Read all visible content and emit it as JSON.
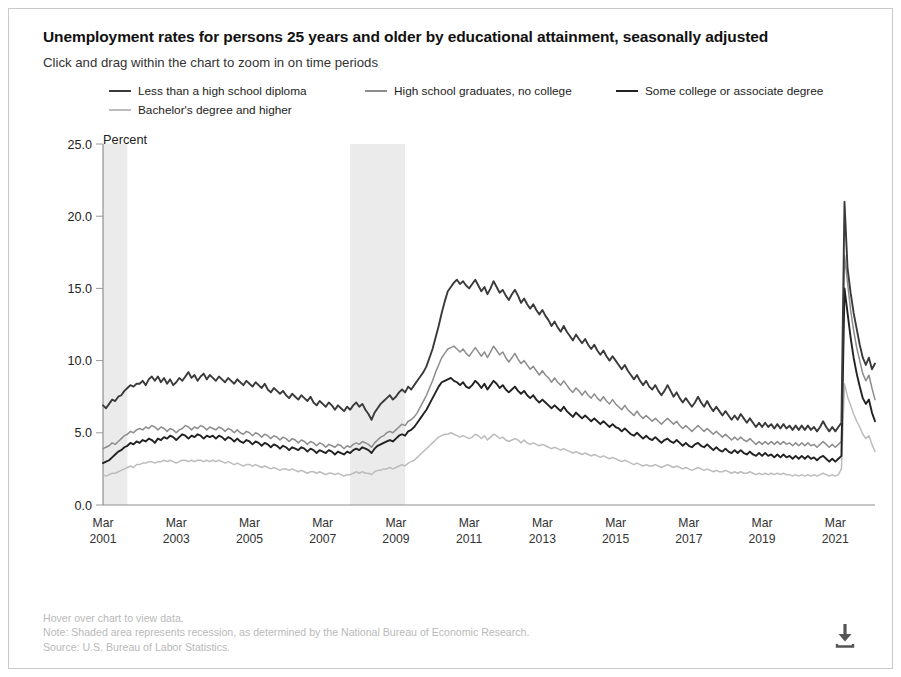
{
  "header": {
    "title": "Unemployment rates for persons 25 years and older by educational attainment, seasonally adjusted",
    "subtitle": "Click and drag within the chart to zoom in on time periods"
  },
  "footer": {
    "hover_hint": "Hover over chart to view data.",
    "note": "Note: Shaded area represents recession, as determined by the National Bureau of Economic Research.",
    "source": "Source: U.S. Bureau of Labor Statistics.",
    "download_icon": "download-icon"
  },
  "chart_data": {
    "type": "line",
    "title": "Unemployment rates for persons 25 years and older by educational attainment, seasonally adjusted",
    "subtitle": "Click and drag within the chart to zoom in on time periods",
    "xlabel": "",
    "ylabel": "Percent",
    "ylim": [
      0.0,
      25.0
    ],
    "ytick_labels": [
      "0.0",
      "5.0",
      "10.0",
      "15.0",
      "20.0",
      "25.0"
    ],
    "ytick_values": [
      0,
      5,
      10,
      15,
      20,
      25
    ],
    "grid": false,
    "legend_position": "top",
    "xtick_labels": [
      "Mar\n2001",
      "Mar\n2003",
      "Mar\n2005",
      "Mar\n2007",
      "Mar\n2009",
      "Mar\n2011",
      "Mar\n2013",
      "Mar\n2015",
      "Mar\n2017",
      "Mar\n2019",
      "Mar\n2021"
    ],
    "xticks": [
      {
        "top": "Mar",
        "bottom": "2001"
      },
      {
        "top": "Mar",
        "bottom": "2003"
      },
      {
        "top": "Mar",
        "bottom": "2005"
      },
      {
        "top": "Mar",
        "bottom": "2007"
      },
      {
        "top": "Mar",
        "bottom": "2009"
      },
      {
        "top": "Mar",
        "bottom": "2011"
      },
      {
        "top": "Mar",
        "bottom": "2013"
      },
      {
        "top": "Mar",
        "bottom": "2015"
      },
      {
        "top": "Mar",
        "bottom": "2017"
      },
      {
        "top": "Mar",
        "bottom": "2019"
      },
      {
        "top": "Mar",
        "bottom": "2021"
      }
    ],
    "x_start": "2001-03",
    "x_end": "2021-03",
    "x_step_months": 1,
    "recessions": [
      {
        "label": "2001 recession",
        "start": "2001-03",
        "end": "2001-11"
      },
      {
        "label": "Great Recession",
        "start": "2007-12",
        "end": "2009-06"
      }
    ],
    "recession_color": "#ebebeb",
    "annotations": [
      "Shaded area represents recession, as determined by the National Bureau of Economic Research."
    ],
    "series": [
      {
        "name": "Less than a high school diploma",
        "color": "#3a3a3a",
        "values": [
          6.9,
          6.7,
          7.0,
          7.3,
          7.2,
          7.5,
          7.6,
          7.9,
          8.1,
          8.3,
          8.2,
          8.4,
          8.4,
          8.6,
          8.3,
          8.7,
          8.9,
          8.6,
          8.9,
          8.5,
          8.8,
          8.4,
          8.7,
          8.3,
          8.5,
          8.8,
          8.6,
          8.9,
          9.2,
          8.8,
          9.0,
          8.6,
          8.9,
          9.1,
          8.7,
          9.0,
          8.8,
          8.6,
          8.9,
          8.7,
          8.5,
          8.8,
          8.6,
          8.4,
          8.7,
          8.5,
          8.3,
          8.6,
          8.4,
          8.2,
          8.5,
          8.3,
          8.1,
          8.4,
          8.0,
          7.8,
          8.1,
          7.9,
          7.7,
          7.9,
          7.6,
          7.4,
          7.7,
          7.5,
          7.3,
          7.6,
          7.4,
          7.2,
          7.5,
          7.1,
          6.9,
          7.2,
          7.0,
          6.8,
          7.1,
          6.9,
          6.6,
          6.9,
          6.7,
          6.5,
          6.8,
          6.6,
          6.9,
          7.1,
          6.8,
          7.0,
          6.6,
          6.3,
          5.9,
          6.4,
          6.7,
          7.0,
          7.2,
          7.4,
          7.6,
          7.3,
          7.5,
          7.8,
          8.0,
          7.8,
          8.2,
          8.0,
          8.3,
          8.6,
          8.9,
          9.2,
          9.6,
          10.2,
          10.8,
          11.6,
          12.4,
          13.3,
          14.1,
          14.8,
          15.1,
          15.4,
          15.6,
          15.3,
          15.5,
          15.2,
          15.0,
          15.3,
          15.6,
          15.2,
          14.8,
          15.1,
          14.6,
          15.0,
          15.5,
          15.1,
          14.7,
          14.9,
          14.5,
          14.2,
          14.6,
          14.9,
          14.5,
          14.0,
          14.3,
          13.9,
          13.6,
          13.9,
          13.5,
          13.2,
          13.5,
          13.1,
          12.8,
          12.4,
          12.7,
          12.3,
          12.0,
          12.4,
          12.0,
          11.7,
          11.4,
          11.8,
          11.5,
          11.2,
          11.5,
          11.1,
          10.8,
          11.1,
          10.7,
          10.4,
          10.7,
          10.3,
          10.0,
          10.3,
          10.0,
          9.7,
          9.4,
          9.7,
          9.3,
          9.0,
          8.7,
          9.0,
          8.6,
          8.3,
          8.6,
          8.2,
          8.0,
          8.3,
          7.9,
          7.6,
          7.9,
          8.3,
          7.9,
          7.5,
          7.8,
          7.4,
          7.1,
          7.4,
          7.1,
          6.8,
          7.1,
          7.5,
          7.1,
          6.8,
          7.2,
          6.8,
          6.5,
          6.8,
          6.5,
          6.2,
          6.5,
          6.2,
          5.9,
          6.2,
          5.9,
          6.3,
          6.0,
          5.7,
          6.0,
          5.7,
          5.4,
          5.7,
          5.4,
          5.7,
          5.4,
          5.6,
          5.3,
          5.6,
          5.3,
          5.6,
          5.3,
          5.5,
          5.2,
          5.5,
          5.2,
          5.5,
          5.2,
          5.5,
          5.2,
          5.4,
          5.1,
          5.4,
          5.8,
          5.4,
          5.1,
          5.4,
          5.1,
          5.4,
          5.7,
          21.0,
          16.4,
          14.7,
          13.3,
          12.2,
          11.1,
          10.2,
          9.7,
          10.2,
          9.4,
          9.8
        ]
      },
      {
        "name": "High school graduates, no college",
        "color": "#8d8d8d",
        "values": [
          3.9,
          4.0,
          4.1,
          4.3,
          4.2,
          4.4,
          4.6,
          4.8,
          4.9,
          5.1,
          5.0,
          5.2,
          5.3,
          5.2,
          5.4,
          5.3,
          5.5,
          5.4,
          5.2,
          5.4,
          5.3,
          5.1,
          5.3,
          5.2,
          5.0,
          5.2,
          5.3,
          5.5,
          5.4,
          5.2,
          5.4,
          5.3,
          5.5,
          5.4,
          5.2,
          5.4,
          5.3,
          5.2,
          5.4,
          5.3,
          5.1,
          5.3,
          5.2,
          5.0,
          5.2,
          5.0,
          4.9,
          5.1,
          5.0,
          4.8,
          5.0,
          4.9,
          4.7,
          4.9,
          4.8,
          4.6,
          4.8,
          4.7,
          4.5,
          4.7,
          4.6,
          4.4,
          4.6,
          4.5,
          4.3,
          4.5,
          4.4,
          4.2,
          4.4,
          4.3,
          4.1,
          4.3,
          4.2,
          4.0,
          4.2,
          4.1,
          4.0,
          4.2,
          4.1,
          3.9,
          4.1,
          4.0,
          4.2,
          4.3,
          4.2,
          4.4,
          4.3,
          4.2,
          4.0,
          4.3,
          4.5,
          4.7,
          4.8,
          5.0,
          5.1,
          5.0,
          5.2,
          5.4,
          5.6,
          5.5,
          5.8,
          5.9,
          6.1,
          6.4,
          6.8,
          7.2,
          7.6,
          8.1,
          8.6,
          9.2,
          9.7,
          10.2,
          10.5,
          10.8,
          10.9,
          11.0,
          10.8,
          10.6,
          10.8,
          10.5,
          10.3,
          10.6,
          10.9,
          10.6,
          10.3,
          10.6,
          10.2,
          10.6,
          11.0,
          10.7,
          10.4,
          10.6,
          10.2,
          9.9,
          10.2,
          10.5,
          10.1,
          9.8,
          10.0,
          9.7,
          9.4,
          9.6,
          9.3,
          9.0,
          9.3,
          9.0,
          8.8,
          8.5,
          8.8,
          8.5,
          8.3,
          8.6,
          8.3,
          8.0,
          7.8,
          8.1,
          7.9,
          7.6,
          7.9,
          7.6,
          7.4,
          7.7,
          7.4,
          7.2,
          7.5,
          7.2,
          7.0,
          7.3,
          7.0,
          6.8,
          6.6,
          6.9,
          6.6,
          6.4,
          6.2,
          6.5,
          6.2,
          6.0,
          6.2,
          6.0,
          5.8,
          6.0,
          5.8,
          5.6,
          5.8,
          6.0,
          5.8,
          5.6,
          5.8,
          5.5,
          5.3,
          5.5,
          5.3,
          5.1,
          5.3,
          5.5,
          5.3,
          5.1,
          5.3,
          5.1,
          4.9,
          5.1,
          4.9,
          4.7,
          4.9,
          4.7,
          4.5,
          4.7,
          4.5,
          4.7,
          4.5,
          4.4,
          4.6,
          4.4,
          4.2,
          4.4,
          4.2,
          4.4,
          4.2,
          4.4,
          4.2,
          4.4,
          4.2,
          4.4,
          4.2,
          4.3,
          4.1,
          4.3,
          4.1,
          4.3,
          4.1,
          4.3,
          4.1,
          4.2,
          4.0,
          4.2,
          4.4,
          4.2,
          4.0,
          4.2,
          4.0,
          4.2,
          4.4,
          17.3,
          15.4,
          13.5,
          12.1,
          10.9,
          10.0,
          9.1,
          8.6,
          9.0,
          8.1,
          7.3
        ]
      },
      {
        "name": "Some college or associate degree",
        "color": "#222222",
        "values": [
          2.9,
          3.0,
          3.1,
          3.3,
          3.5,
          3.7,
          3.8,
          4.0,
          4.1,
          4.3,
          4.2,
          4.4,
          4.3,
          4.5,
          4.4,
          4.6,
          4.5,
          4.3,
          4.6,
          4.5,
          4.7,
          4.6,
          4.8,
          4.7,
          4.5,
          4.7,
          4.9,
          4.8,
          4.6,
          4.8,
          4.7,
          4.9,
          4.8,
          4.6,
          4.8,
          4.7,
          4.8,
          4.6,
          4.8,
          4.7,
          4.5,
          4.7,
          4.6,
          4.4,
          4.6,
          4.4,
          4.3,
          4.5,
          4.4,
          4.2,
          4.4,
          4.3,
          4.1,
          4.3,
          4.2,
          4.0,
          4.2,
          4.1,
          3.9,
          4.1,
          4.0,
          3.8,
          4.0,
          3.9,
          3.8,
          4.0,
          3.9,
          3.7,
          3.9,
          3.8,
          3.6,
          3.8,
          3.7,
          3.6,
          3.8,
          3.7,
          3.5,
          3.7,
          3.6,
          3.5,
          3.7,
          3.6,
          3.8,
          3.9,
          3.8,
          4.0,
          3.9,
          3.8,
          3.6,
          3.9,
          4.1,
          4.2,
          4.3,
          4.4,
          4.5,
          4.4,
          4.6,
          4.8,
          4.9,
          4.8,
          5.1,
          5.2,
          5.4,
          5.7,
          6.0,
          6.3,
          6.6,
          7.0,
          7.4,
          7.8,
          8.2,
          8.5,
          8.6,
          8.7,
          8.8,
          8.6,
          8.5,
          8.3,
          8.5,
          8.2,
          8.1,
          8.3,
          8.6,
          8.4,
          8.1,
          8.4,
          8.0,
          8.3,
          8.6,
          8.4,
          8.1,
          8.3,
          8.0,
          7.8,
          8.0,
          8.2,
          7.9,
          7.7,
          7.9,
          7.6,
          7.4,
          7.6,
          7.3,
          7.1,
          7.3,
          7.1,
          6.9,
          6.7,
          6.9,
          6.7,
          6.5,
          6.8,
          6.5,
          6.3,
          6.1,
          6.4,
          6.2,
          6.0,
          6.2,
          6.0,
          5.8,
          6.0,
          5.8,
          5.6,
          5.8,
          5.6,
          5.4,
          5.6,
          5.4,
          5.3,
          5.1,
          5.3,
          5.1,
          4.9,
          4.8,
          5.0,
          4.8,
          4.6,
          4.8,
          4.6,
          4.5,
          4.7,
          4.5,
          4.3,
          4.5,
          4.6,
          4.4,
          4.3,
          4.5,
          4.3,
          4.1,
          4.3,
          4.1,
          4.0,
          4.2,
          4.3,
          4.1,
          4.0,
          4.2,
          4.0,
          3.8,
          4.0,
          3.8,
          3.7,
          3.9,
          3.7,
          3.6,
          3.8,
          3.6,
          3.8,
          3.6,
          3.5,
          3.7,
          3.5,
          3.4,
          3.6,
          3.4,
          3.6,
          3.4,
          3.5,
          3.3,
          3.5,
          3.3,
          3.5,
          3.3,
          3.4,
          3.2,
          3.4,
          3.2,
          3.4,
          3.2,
          3.4,
          3.2,
          3.3,
          3.1,
          3.3,
          3.4,
          3.2,
          3.0,
          3.2,
          3.0,
          3.2,
          3.4,
          15.0,
          13.3,
          11.6,
          10.2,
          9.1,
          8.2,
          7.4,
          7.0,
          7.3,
          6.4,
          5.8
        ]
      },
      {
        "name": "Bachelor's degree and higher",
        "color": "#bcbcbc",
        "values": [
          2.1,
          2.0,
          2.1,
          2.2,
          2.2,
          2.3,
          2.4,
          2.5,
          2.6,
          2.7,
          2.6,
          2.8,
          2.8,
          2.9,
          2.9,
          3.0,
          3.0,
          2.9,
          3.0,
          3.0,
          3.1,
          3.0,
          3.1,
          3.0,
          2.9,
          3.0,
          3.1,
          3.1,
          3.0,
          3.1,
          3.0,
          3.1,
          3.1,
          3.0,
          3.1,
          3.0,
          3.1,
          3.0,
          3.1,
          3.0,
          2.9,
          3.0,
          2.9,
          2.8,
          2.9,
          2.8,
          2.7,
          2.8,
          2.8,
          2.7,
          2.8,
          2.7,
          2.6,
          2.7,
          2.6,
          2.5,
          2.6,
          2.5,
          2.4,
          2.5,
          2.5,
          2.4,
          2.5,
          2.4,
          2.3,
          2.4,
          2.3,
          2.2,
          2.3,
          2.3,
          2.2,
          2.3,
          2.2,
          2.1,
          2.2,
          2.2,
          2.1,
          2.2,
          2.1,
          2.0,
          2.1,
          2.1,
          2.2,
          2.3,
          2.2,
          2.3,
          2.2,
          2.2,
          2.1,
          2.3,
          2.4,
          2.4,
          2.5,
          2.5,
          2.6,
          2.5,
          2.6,
          2.7,
          2.8,
          2.7,
          2.9,
          3.0,
          3.1,
          3.3,
          3.5,
          3.7,
          3.9,
          4.1,
          4.3,
          4.5,
          4.7,
          4.8,
          4.9,
          4.9,
          5.0,
          4.9,
          4.8,
          4.7,
          4.8,
          4.7,
          4.6,
          4.7,
          4.9,
          4.8,
          4.6,
          4.8,
          4.5,
          4.7,
          4.9,
          4.8,
          4.6,
          4.7,
          4.5,
          4.4,
          4.5,
          4.6,
          4.5,
          4.3,
          4.5,
          4.3,
          4.2,
          4.3,
          4.2,
          4.1,
          4.2,
          4.1,
          4.0,
          3.9,
          4.0,
          3.9,
          3.8,
          3.9,
          3.8,
          3.7,
          3.6,
          3.7,
          3.6,
          3.5,
          3.6,
          3.5,
          3.4,
          3.5,
          3.4,
          3.3,
          3.4,
          3.3,
          3.2,
          3.3,
          3.2,
          3.1,
          3.0,
          3.1,
          3.0,
          2.9,
          2.8,
          2.9,
          2.8,
          2.7,
          2.8,
          2.7,
          2.7,
          2.8,
          2.7,
          2.6,
          2.7,
          2.8,
          2.7,
          2.6,
          2.7,
          2.6,
          2.5,
          2.6,
          2.5,
          2.4,
          2.5,
          2.6,
          2.5,
          2.4,
          2.5,
          2.4,
          2.3,
          2.4,
          2.3,
          2.3,
          2.4,
          2.3,
          2.2,
          2.3,
          2.2,
          2.3,
          2.2,
          2.2,
          2.3,
          2.2,
          2.1,
          2.2,
          2.1,
          2.2,
          2.1,
          2.2,
          2.1,
          2.2,
          2.1,
          2.2,
          2.1,
          2.1,
          2.0,
          2.1,
          2.0,
          2.1,
          2.0,
          2.1,
          2.0,
          2.1,
          2.0,
          2.1,
          2.2,
          2.1,
          2.0,
          2.1,
          2.0,
          2.1,
          2.5,
          8.4,
          7.5,
          6.9,
          6.3,
          5.8,
          5.4,
          4.9,
          4.6,
          4.8,
          4.2,
          3.7
        ]
      }
    ]
  }
}
